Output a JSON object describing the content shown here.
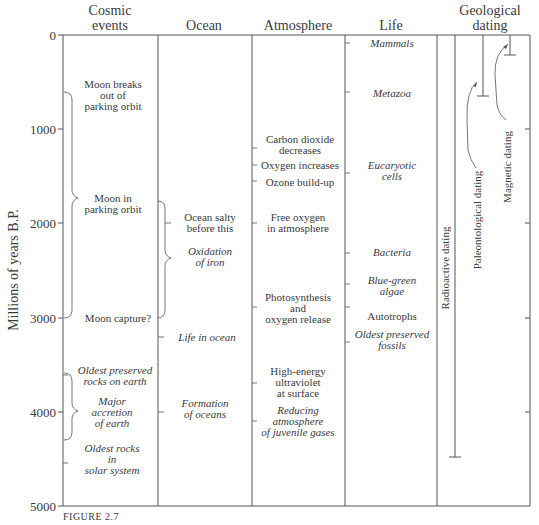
{
  "figure_caption": "FIGURE 2.7",
  "y_axis": {
    "title": "Millions of years B.P.",
    "ticks": [
      "0",
      "1000",
      "2000",
      "3000",
      "4000",
      "5000"
    ],
    "range": [
      0,
      5000
    ]
  },
  "columns": {
    "cosmic": {
      "header_line1": "Cosmic",
      "header_line2": "events"
    },
    "ocean": {
      "header": "Ocean"
    },
    "atmosphere": {
      "header": "Atmosphere"
    },
    "life": {
      "header": "Life"
    },
    "geological": {
      "header_line1": "Geological",
      "header_line2": "dating"
    }
  },
  "cosmic_events": [
    {
      "lines": [
        "Moon breaks",
        "out of",
        "parking orbit"
      ],
      "italic": false,
      "age": 650
    },
    {
      "lines": [
        "Moon in",
        "parking orbit"
      ],
      "italic": false,
      "age": 1750,
      "bracket": [
        600,
        3000
      ]
    },
    {
      "lines": [
        "Moon capture?"
      ],
      "italic": false,
      "age": 3000
    },
    {
      "lines": [
        "Oldest preserved",
        "rocks on earth"
      ],
      "italic": true,
      "age": 3600
    },
    {
      "lines": [
        "Major",
        "accretion",
        "of earth"
      ],
      "italic": true,
      "age": 4000,
      "bracket": [
        3700,
        4300
      ]
    },
    {
      "lines": [
        "Oldest rocks",
        "in",
        "solar system"
      ],
      "italic": true,
      "age": 4550
    }
  ],
  "ocean": [
    {
      "lines": [
        "Ocean salty",
        "before this"
      ],
      "italic": false,
      "age": 2000,
      "bracket": [
        1750,
        3000
      ]
    },
    {
      "lines": [
        "Oxidation",
        "of iron"
      ],
      "italic": true,
      "age": 2450
    },
    {
      "lines": [
        "Life in ocean"
      ],
      "italic": true,
      "age": 3200
    },
    {
      "lines": [
        "Formation",
        "of oceans"
      ],
      "italic": true,
      "age": 4000
    }
  ],
  "atmosphere": [
    {
      "lines": [
        "Carbon dioxide",
        "decreases"
      ],
      "italic": false,
      "age": 1200
    },
    {
      "lines": [
        "Oxygen increases"
      ],
      "italic": false,
      "age": 1450
    },
    {
      "lines": [
        "Ozone build-up"
      ],
      "italic": false,
      "age": 1550
    },
    {
      "lines": [
        "Free oxygen",
        "in atmosphere"
      ],
      "italic": false,
      "age": 2000
    },
    {
      "lines": [
        "Photosynthesis",
        "and",
        "oxygen release"
      ],
      "italic": false,
      "age": 2900
    },
    {
      "lines": [
        "High-energy",
        "ultraviolet",
        "at surface"
      ],
      "italic": false,
      "age": 3700
    },
    {
      "lines": [
        "Reducing",
        "atmosphere",
        "of juvenile gases"
      ],
      "italic": true,
      "age": 4100
    }
  ],
  "life": [
    {
      "lines": [
        "Mammals"
      ],
      "italic": true,
      "age": 65
    },
    {
      "lines": [
        "Metazoa"
      ],
      "italic": true,
      "age": 600
    },
    {
      "lines": [
        "Eucaryotic",
        "cells"
      ],
      "italic": true,
      "age": 1450
    },
    {
      "lines": [
        "Bacteria"
      ],
      "italic": true,
      "age": 2300
    },
    {
      "lines": [
        "Blue-green",
        "algae"
      ],
      "italic": true,
      "age": 2650
    },
    {
      "lines": [
        "Autotrophs"
      ],
      "italic": false,
      "age": 2900
    },
    {
      "lines": [
        "Oldest preserved",
        "fossils"
      ],
      "italic": true,
      "age": 3250
    }
  ],
  "geological_dating": [
    {
      "label": "Radioactive dating",
      "range": [
        0,
        4500
      ]
    },
    {
      "label": "Paleontological dating",
      "range": [
        0,
        650
      ]
    },
    {
      "label": "Magnetic dating",
      "range": [
        0,
        200
      ]
    }
  ]
}
